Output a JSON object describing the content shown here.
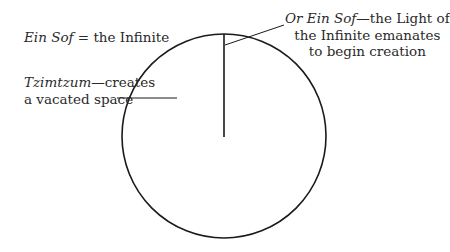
{
  "diagram": {
    "circle": {
      "cx": 224,
      "cy": 136,
      "r": 102,
      "stroke": "#1a1a1a"
    },
    "ray": {
      "x1": 224,
      "y1": 34,
      "x2": 224,
      "y2": 137
    },
    "labels": {
      "ein_sof": {
        "italic": "Ein Sof",
        "rest": " = the Infinite"
      },
      "tzimtzum": {
        "italic": "Tzimtzum",
        "rest_line1": "—creates",
        "line2": "a vacated space"
      },
      "light": {
        "italic": "Or Ein Sof",
        "rest_line1": "—the Light of",
        "line2": "the Infinite emanates",
        "line3": "to begin creation"
      }
    }
  }
}
